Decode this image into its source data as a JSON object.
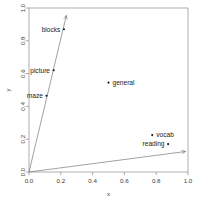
{
  "chart_data": {
    "type": "scatter",
    "title": "",
    "subtitle": "",
    "xlabel": "x",
    "ylabel": "y",
    "xlim": [
      0.0,
      1.0
    ],
    "ylim": [
      0.0,
      1.0
    ],
    "grid": false,
    "legend": "none",
    "xticks": [
      "0.0",
      "0.2",
      "0.4",
      "0.6",
      "0.8",
      "1.0"
    ],
    "xtick_values": [
      0.0,
      0.2,
      0.4,
      0.6,
      0.8,
      1.0
    ],
    "yticks": [
      "0.0",
      "0.2",
      "0.4",
      "0.6",
      "0.8",
      "1.0"
    ],
    "ytick_values": [
      0.0,
      0.2,
      0.4,
      0.6,
      0.8,
      1.0
    ],
    "points": [
      {
        "label": "blocks",
        "x": 0.22,
        "y": 0.87,
        "label_side": "left"
      },
      {
        "label": "picture",
        "x": 0.155,
        "y": 0.62,
        "label_side": "left"
      },
      {
        "label": "maze",
        "x": 0.11,
        "y": 0.465,
        "label_side": "left"
      },
      {
        "label": "general",
        "x": 0.5,
        "y": 0.545,
        "label_side": "right"
      },
      {
        "label": "vocab",
        "x": 0.775,
        "y": 0.225,
        "label_side": "right"
      },
      {
        "label": "reading",
        "x": 0.875,
        "y": 0.17,
        "label_side": "left"
      }
    ],
    "vectors": [
      {
        "name": "vector-1",
        "x0": 0.0,
        "y0": 0.0,
        "x1": 0.235,
        "y1": 0.955
      },
      {
        "name": "vector-2",
        "x0": 0.0,
        "y0": 0.0,
        "x1": 0.985,
        "y1": 0.125
      }
    ],
    "colors": {
      "point": "#111111",
      "axis": "#8c8c8c",
      "vector": "#6e6e6e",
      "text": "#1a1a1a",
      "background": "#ffffff"
    }
  }
}
